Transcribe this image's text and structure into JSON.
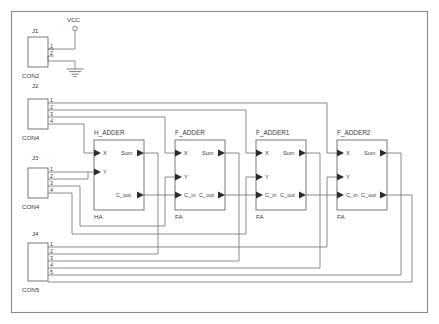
{
  "sheet": {
    "title": "4-bit Ripple Carry Adder Schematic",
    "width": 439,
    "height": 324,
    "background": "#ffffff",
    "wire_color": "#6e6e6e",
    "outline_color": "#6a6a6a",
    "text_color": "#3a3a3a"
  },
  "power": {
    "vcc_label": "VCC",
    "gnd_label": ""
  },
  "connectors": [
    {
      "ref": "J1",
      "type": "CON2",
      "pins": [
        "1",
        "2"
      ],
      "x": 28,
      "y": 37,
      "w": 20,
      "h": 30
    },
    {
      "ref": "J2",
      "type": "CON4",
      "pins": [
        "1",
        "2",
        "3",
        "4"
      ],
      "x": 28,
      "y": 99,
      "w": 20,
      "h": 30
    },
    {
      "ref": "J3",
      "type": "CON4",
      "pins": [
        "1",
        "2",
        "3",
        "4"
      ],
      "x": 28,
      "y": 168,
      "w": 20,
      "h": 30
    },
    {
      "ref": "J4",
      "type": "CON5",
      "pins": [
        "1",
        "2",
        "3",
        "4",
        "5"
      ],
      "x": 28,
      "y": 243,
      "w": 20,
      "h": 38
    }
  ],
  "blocks": [
    {
      "title": "H_ADDER",
      "ref": "HA",
      "x": 94,
      "y": 140,
      "w": 50,
      "h": 70,
      "inputs": [
        "X",
        "Y"
      ],
      "outputs": [
        "Sum",
        "C_out"
      ],
      "has_cin": false
    },
    {
      "title": "F_ADDER",
      "ref": "FA",
      "x": 175,
      "y": 140,
      "w": 50,
      "h": 70,
      "inputs": [
        "X",
        "Y",
        "C_in"
      ],
      "outputs": [
        "Sum",
        "C_out"
      ],
      "has_cin": true
    },
    {
      "title": "F_ADDER1",
      "ref": "FA",
      "x": 256,
      "y": 140,
      "w": 50,
      "h": 70,
      "inputs": [
        "X",
        "Y",
        "C_in"
      ],
      "outputs": [
        "Sum",
        "C_out"
      ],
      "has_cin": true
    },
    {
      "title": "F_ADDER2",
      "ref": "FA",
      "x": 337,
      "y": 140,
      "w": 50,
      "h": 70,
      "inputs": [
        "X",
        "Y",
        "C_in"
      ],
      "outputs": [
        "Sum",
        "C_out"
      ],
      "has_cin": true
    }
  ],
  "pin_labels": {
    "x": "X",
    "y": "Y",
    "c_in": "C_in",
    "sum": "Sum",
    "c_out": "C_out"
  }
}
